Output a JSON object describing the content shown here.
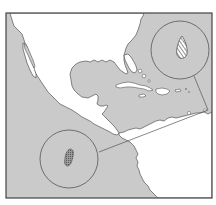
{
  "map": {
    "type": "locator-map",
    "region": "Gulf of Mexico and Caribbean",
    "colors": {
      "water": "#c9c9c9",
      "land": "#ffffff",
      "outline": "#555555",
      "frame": "#444444",
      "callout": "#555555",
      "hatch": "#666666"
    },
    "callouts": [
      {
        "name": "northeast-callout",
        "cx": 178,
        "cy": 50,
        "r": 30,
        "feature": "hatched-teardrop"
      },
      {
        "name": "southwest-callout",
        "cx": 70,
        "cy": 160,
        "r": 30,
        "feature": "stippled-blob"
      }
    ]
  }
}
